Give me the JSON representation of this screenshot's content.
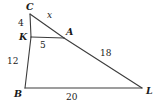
{
  "figure": {
    "type": "geometry-diagram",
    "stroke_color": "#3c3c3c",
    "background_color": "#ffffff",
    "text_color": "#1a1a1a",
    "vertices": [
      {
        "id": "C",
        "label": "C",
        "x": 30,
        "y": 14
      },
      {
        "id": "K",
        "label": "K",
        "x": 31,
        "y": 37
      },
      {
        "id": "A",
        "label": "A",
        "x": 64,
        "y": 38
      },
      {
        "id": "B",
        "label": "B",
        "x": 25,
        "y": 88
      },
      {
        "id": "L",
        "label": "L",
        "x": 142,
        "y": 88
      }
    ],
    "segments": [
      {
        "id": "CK",
        "from": "C",
        "to": "K",
        "label": "4",
        "label_x": 20,
        "label_y": 24
      },
      {
        "id": "CA",
        "from": "C",
        "to": "A",
        "label": "x",
        "label_x": 48,
        "label_y": 15
      },
      {
        "id": "KA",
        "from": "K",
        "to": "A",
        "label": "5",
        "label_x": 42,
        "label_y": 45
      },
      {
        "id": "AL",
        "from": "A",
        "to": "L",
        "label": "18",
        "label_x": 103,
        "label_y": 55
      },
      {
        "id": "KB",
        "from": "K",
        "to": "B",
        "label": "12",
        "label_x": 10,
        "label_y": 62
      },
      {
        "id": "BL",
        "from": "B",
        "to": "L",
        "label": "20",
        "label_x": 69,
        "label_y": 95
      }
    ],
    "vertex_labels": {
      "C": "C",
      "K": "K",
      "A": "A",
      "B": "B",
      "L": "L"
    },
    "measures": {
      "CK": "4",
      "CA": "x",
      "KA": "5",
      "AL": "18",
      "KB": "12",
      "BL": "20"
    },
    "label_positions": {
      "C": {
        "x": 26,
        "y": 2
      },
      "K": {
        "x": 19,
        "y": 32
      },
      "A": {
        "x": 66,
        "y": 27
      },
      "B": {
        "x": 14,
        "y": 89
      },
      "L": {
        "x": 146,
        "y": 86
      },
      "CK": {
        "x": 18,
        "y": 19
      },
      "CA": {
        "x": 47,
        "y": 11
      },
      "KA": {
        "x": 40,
        "y": 41
      },
      "AL": {
        "x": 100,
        "y": 49
      },
      "KB": {
        "x": 7,
        "y": 57
      },
      "BL": {
        "x": 66,
        "y": 93
      }
    }
  }
}
